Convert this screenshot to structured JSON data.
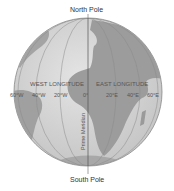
{
  "poles": {
    "north": "North Pole",
    "south": "South Pole"
  },
  "hemispheres": {
    "west": "WEST LONGITUDE",
    "east": "EAST LONGITUDE"
  },
  "meridian_label": "Prime Meridian",
  "longitudes": [
    {
      "label": "60°W",
      "x": 20
    },
    {
      "label": "40°W",
      "x": 40
    },
    {
      "label": "20°W",
      "x": 60
    },
    {
      "label": "0°",
      "x": 87
    },
    {
      "label": "20°E",
      "x": 113
    },
    {
      "label": "40°E",
      "x": 134
    },
    {
      "label": "60°E",
      "x": 153
    }
  ],
  "colors": {
    "ocean": "#d6d6d6",
    "land": "#9a9a9a",
    "outline": "#7a7a7a",
    "grid": "#888888"
  }
}
